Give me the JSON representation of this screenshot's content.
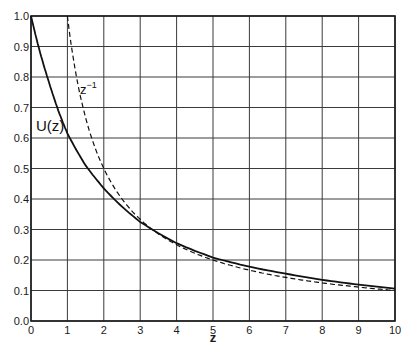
{
  "chart_data": {
    "type": "line",
    "title": "",
    "xlabel": "z",
    "ylabel": "",
    "xlim": [
      0,
      10
    ],
    "ylim": [
      0.0,
      1.0
    ],
    "grid": true,
    "legend": "none (inline curve labels)",
    "x_ticks": [
      "0",
      "1",
      "2",
      "3",
      "4",
      "5",
      "6",
      "7",
      "8",
      "9",
      "10"
    ],
    "y_ticks": [
      "0.0",
      "0.1",
      "0.2",
      "0.3",
      "0.4",
      "0.5",
      "0.6",
      "0.7",
      "0.8",
      "0.9",
      "1.0"
    ],
    "series": [
      {
        "name": "U(z)",
        "style": "solid",
        "x": [
          0,
          0.25,
          0.5,
          0.75,
          1,
          1.5,
          2,
          2.5,
          3,
          4,
          5,
          6,
          7,
          8,
          9,
          10
        ],
        "values": [
          1.0,
          0.88,
          0.78,
          0.69,
          0.615,
          0.51,
          0.435,
          0.375,
          0.325,
          0.255,
          0.208,
          0.178,
          0.155,
          0.135,
          0.119,
          0.106
        ]
      },
      {
        "name": "z^-1",
        "style": "dashed",
        "x": [
          1,
          1.25,
          1.5,
          1.75,
          2,
          2.5,
          3,
          4,
          5,
          6,
          7,
          8,
          9,
          10
        ],
        "values": [
          1.0,
          0.8,
          0.667,
          0.571,
          0.5,
          0.4,
          0.333,
          0.25,
          0.2,
          0.167,
          0.143,
          0.125,
          0.111,
          0.1
        ]
      }
    ],
    "annotations": [
      {
        "text": "U(z)",
        "near_x": 0.5,
        "near_y": 0.64
      },
      {
        "text": "z⁻¹",
        "near_x": 1.6,
        "near_y": 0.76
      }
    ]
  },
  "labels": {
    "x_axis": "z",
    "u_curve": "U(z)",
    "z_inv_base": "z",
    "z_inv_exp": "−1"
  }
}
